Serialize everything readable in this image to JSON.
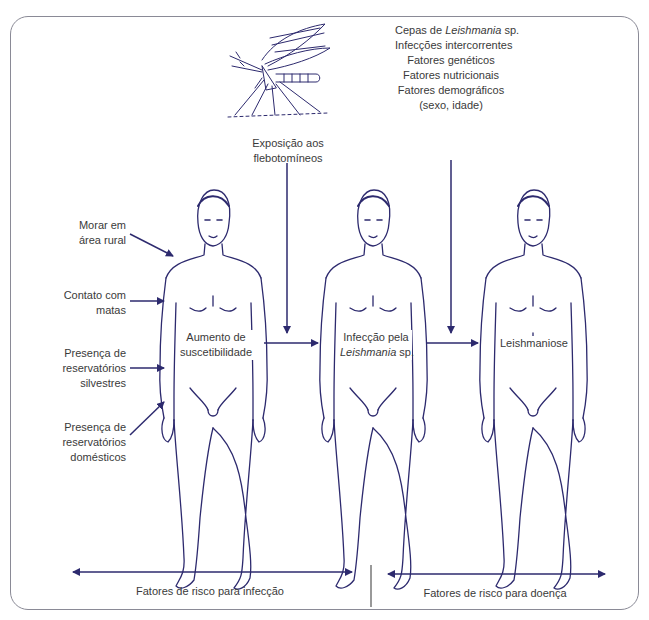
{
  "diagram": {
    "colors": {
      "stroke": "#2d2a6e",
      "text": "#3a3a3a",
      "frame": "#8a8a96"
    },
    "vector": {
      "name": "sandfly-icon",
      "label": "flebotomíneo"
    },
    "exposure": {
      "line1": "Exposição aos",
      "line2": "flebotomíneos"
    },
    "disease_factors": [
      {
        "pre": "Cepas de ",
        "italic": "Leishmania",
        "post": " sp."
      },
      {
        "text": "Infecções intercorrentes"
      },
      {
        "text": "Fatores genéticos"
      },
      {
        "text": "Fatores nutricionais"
      },
      {
        "text": "Fatores demográficos"
      },
      {
        "text": "(sexo, idade)"
      }
    ],
    "risk_factors": [
      {
        "line1": "Morar em",
        "line2": "área rural"
      },
      {
        "line1": "Contato com",
        "line2": "matas"
      },
      {
        "line1": "Presença de",
        "line2": "reservatórios",
        "line3": "silvestres"
      },
      {
        "line1": "Presença de",
        "line2": "reservatórios",
        "line3": "domésticos"
      }
    ],
    "stages": [
      {
        "line1": "Aumento de",
        "line2": "suscetibilidade"
      },
      {
        "line1": "Infecção pela",
        "italic": "Leishmania",
        "post": " sp."
      },
      {
        "line1": "Leishmaniose"
      }
    ],
    "bottom": {
      "left": "Fatores de risco para infecção",
      "right": "Fatores de risco para doença"
    }
  }
}
